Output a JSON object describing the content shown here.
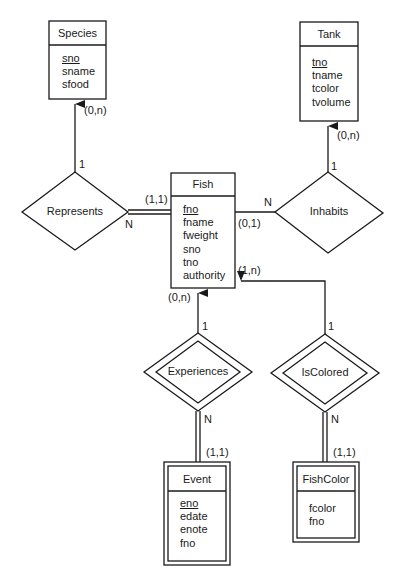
{
  "diagram": {
    "type": "ER diagram",
    "entities": [
      {
        "id": "species",
        "name": "Species",
        "weak": false,
        "attributes": [
          {
            "name": "sno",
            "key": true
          },
          {
            "name": "sname",
            "key": false
          },
          {
            "name": "sfood",
            "key": false
          }
        ]
      },
      {
        "id": "tank",
        "name": "Tank",
        "weak": false,
        "attributes": [
          {
            "name": "tno",
            "key": true
          },
          {
            "name": "tname",
            "key": false
          },
          {
            "name": "tcolor",
            "key": false
          },
          {
            "name": "tvolume",
            "key": false
          }
        ]
      },
      {
        "id": "fish",
        "name": "Fish",
        "weak": false,
        "attributes": [
          {
            "name": "fno",
            "key": true
          },
          {
            "name": "fname",
            "key": false
          },
          {
            "name": "fweight",
            "key": false
          },
          {
            "name": "sno",
            "key": false
          },
          {
            "name": "tno",
            "key": false
          },
          {
            "name": "authority",
            "key": false
          }
        ]
      },
      {
        "id": "event",
        "name": "Event",
        "weak": true,
        "attributes": [
          {
            "name": "eno",
            "key": true
          },
          {
            "name": "edate",
            "key": false
          },
          {
            "name": "enote",
            "key": false
          },
          {
            "name": "fno",
            "key": false
          }
        ]
      },
      {
        "id": "fishcolor",
        "name": "FishColor",
        "weak": true,
        "attributes": [
          {
            "name": "fcolor",
            "key": false
          },
          {
            "name": "fno",
            "key": false
          }
        ]
      }
    ],
    "relationships": [
      {
        "id": "represents",
        "name": "Represents",
        "identifying": false,
        "ends": [
          {
            "entity": "Species",
            "cardinality": "1",
            "participation": "(0,n)"
          },
          {
            "entity": "Fish",
            "cardinality": "N",
            "participation": "(1,1)"
          }
        ]
      },
      {
        "id": "inhabits",
        "name": "Inhabits",
        "identifying": false,
        "ends": [
          {
            "entity": "Tank",
            "cardinality": "1",
            "participation": "(0,n)"
          },
          {
            "entity": "Fish",
            "cardinality": "N",
            "participation": "(0,1)"
          }
        ]
      },
      {
        "id": "experiences",
        "name": "Experiences",
        "identifying": true,
        "ends": [
          {
            "entity": "Fish",
            "cardinality": "1",
            "participation": "(0,n)"
          },
          {
            "entity": "Event",
            "cardinality": "N",
            "participation": "(1,1)"
          }
        ]
      },
      {
        "id": "iscolored",
        "name": "IsColored",
        "identifying": true,
        "ends": [
          {
            "entity": "Fish",
            "cardinality": "1",
            "participation": "(1,n)"
          },
          {
            "entity": "FishColor",
            "cardinality": "N",
            "participation": "(1,1)"
          }
        ]
      }
    ],
    "labels": {
      "species_participation": "(0,n)",
      "species_card": "1",
      "tank_participation": "(0,n)",
      "tank_card": "1",
      "represents_fish_participation": "(1,1)",
      "represents_fish_card": "N",
      "inhabits_fish_participation": "(0,1)",
      "inhabits_fish_card": "N",
      "experiences_fish_participation": "(0,n)",
      "experiences_fish_card": "1",
      "iscolored_fish_participation": "(1,n)",
      "iscolored_fish_card": "1",
      "experiences_event_card": "N",
      "experiences_event_participation": "(1,1)",
      "iscolored_fishcolor_card": "N",
      "iscolored_fishcolor_participation": "(1,1)"
    },
    "colors": {
      "stroke": "#1a1a1a",
      "background": "#ffffff"
    }
  }
}
